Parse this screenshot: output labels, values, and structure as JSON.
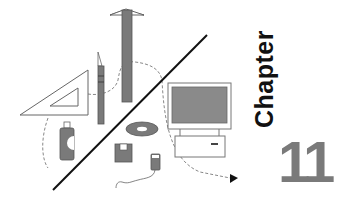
{
  "chapter": {
    "label": "Chapter",
    "number": "11"
  },
  "colors": {
    "fill_gray": "#7a7a7a",
    "outline": "#555555",
    "dark_line": "#111111",
    "screen_gray": "#8a8a8a"
  },
  "illustration": {
    "icons": [
      "t-square-icon",
      "set-square-icon",
      "pencil-icon",
      "spray-can-icon",
      "cd-disc-icon",
      "floppy-disk-icon",
      "mouse-icon",
      "computer-icon",
      "arrow-icon"
    ]
  }
}
